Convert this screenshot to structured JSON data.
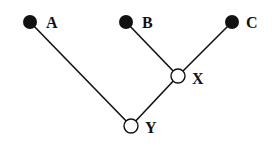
{
  "diagram": {
    "type": "tree",
    "nodes": [
      {
        "id": "A",
        "label": "A",
        "x": 30,
        "y": 22,
        "filled": true
      },
      {
        "id": "B",
        "label": "B",
        "x": 126,
        "y": 22,
        "filled": true
      },
      {
        "id": "C",
        "label": "C",
        "x": 232,
        "y": 22,
        "filled": true
      },
      {
        "id": "X",
        "label": "X",
        "x": 178,
        "y": 76,
        "filled": false
      },
      {
        "id": "Y",
        "label": "Y",
        "x": 131,
        "y": 126,
        "filled": false
      }
    ],
    "edges": [
      {
        "from": "A",
        "to": "Y"
      },
      {
        "from": "B",
        "to": "X"
      },
      {
        "from": "C",
        "to": "X"
      },
      {
        "from": "X",
        "to": "Y"
      }
    ]
  }
}
